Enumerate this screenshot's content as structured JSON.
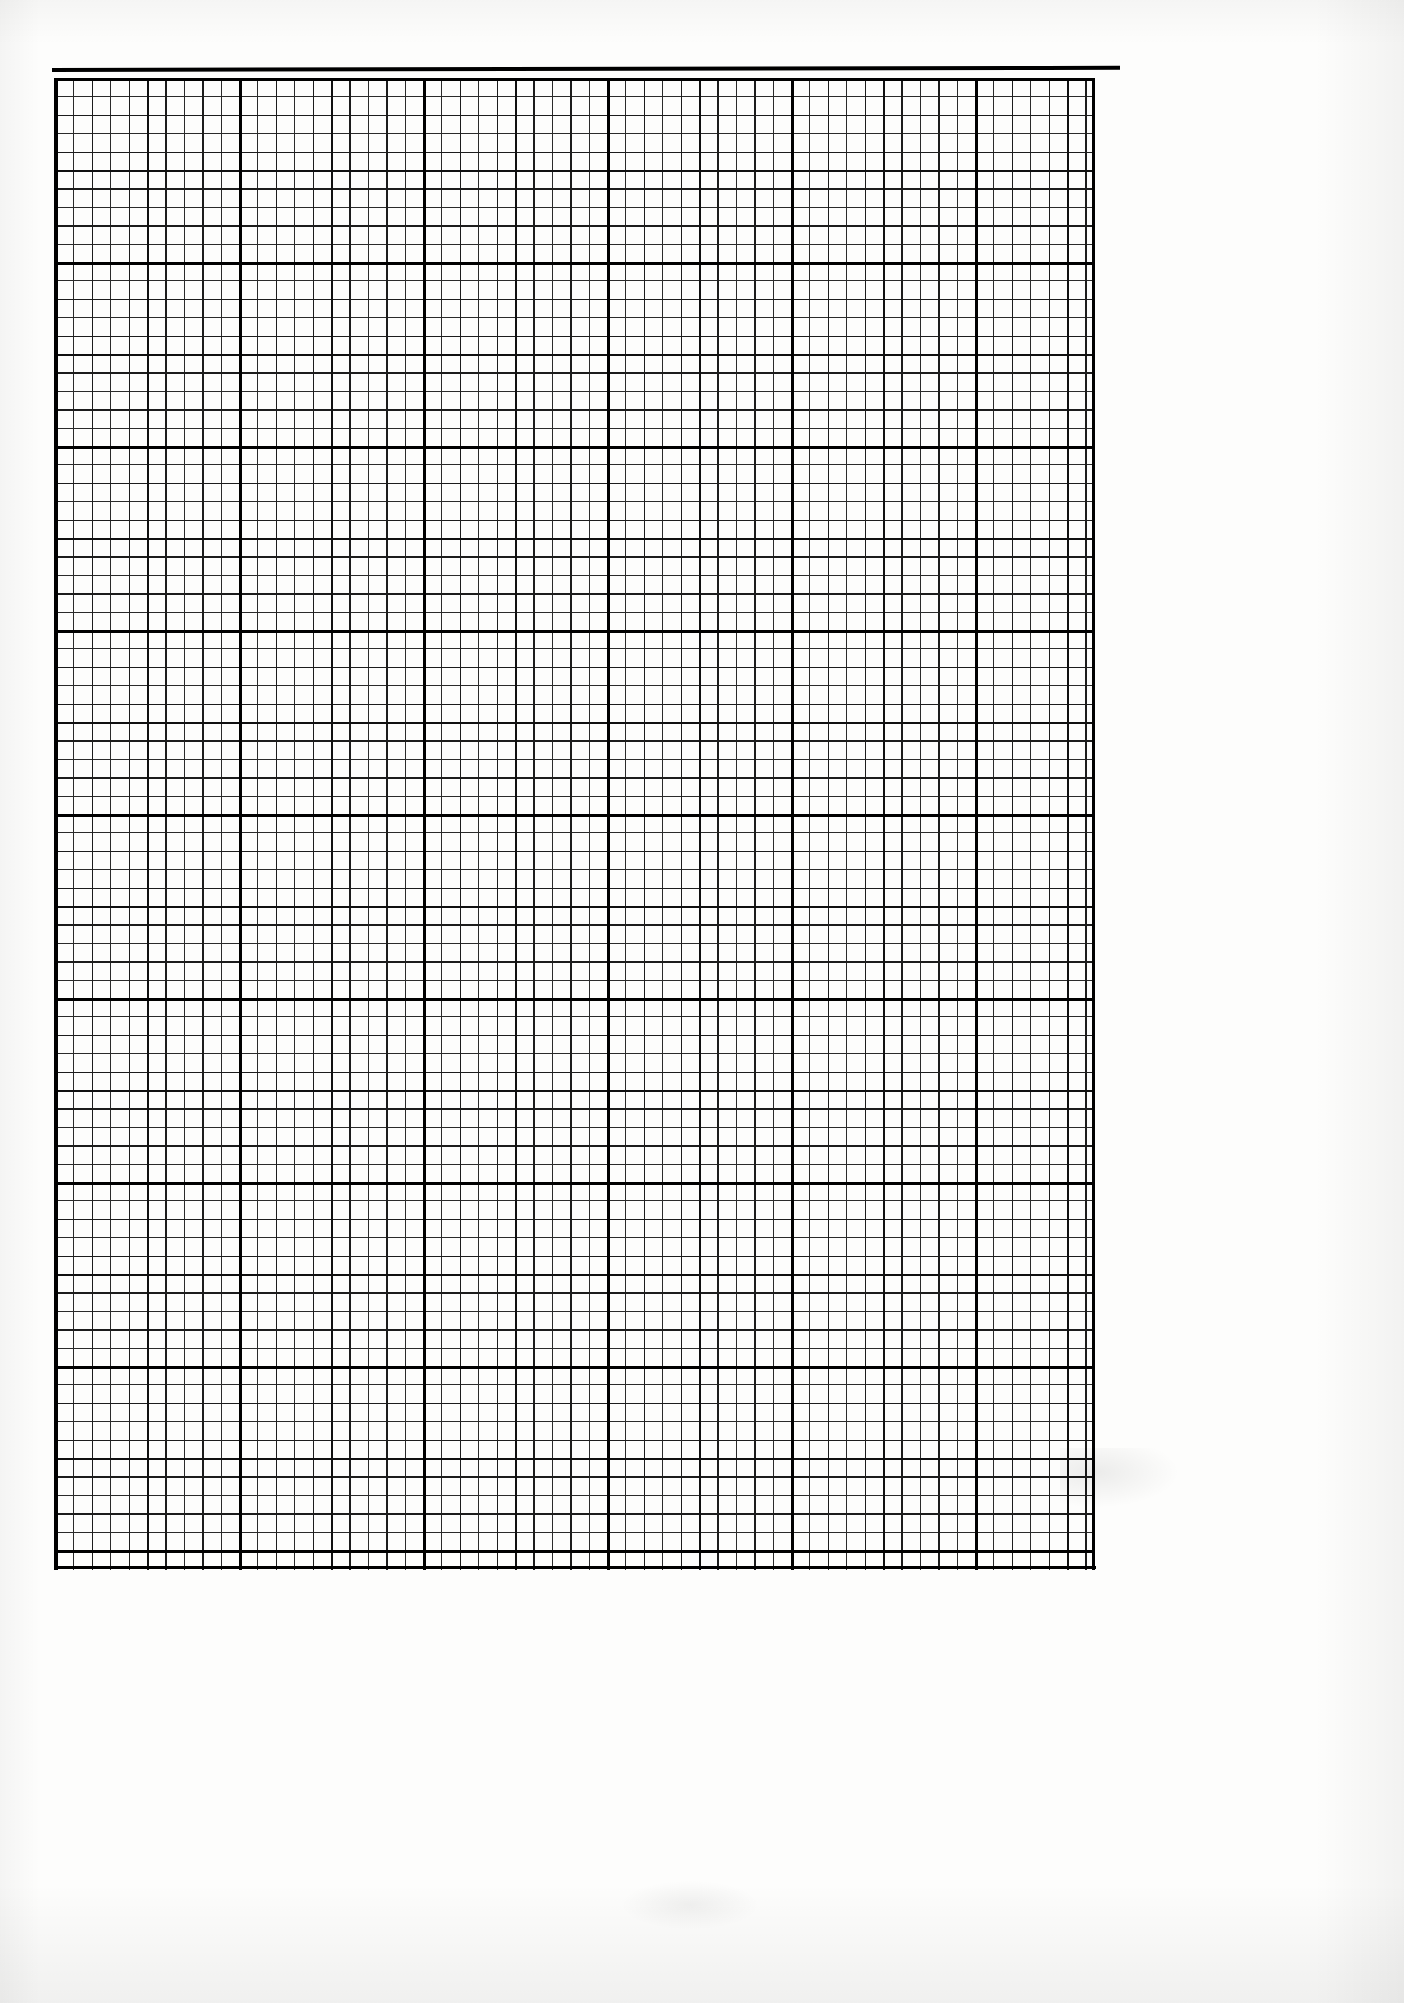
{
  "document": {
    "kind": "graph-paper-scan",
    "title": "Blank graph paper sheet",
    "background_color": "#fdfdfc",
    "ink_color": "#000000",
    "page_width_px": 1404,
    "page_height_px": 2003,
    "text_content": "",
    "annotations": []
  },
  "grid": {
    "description": "Blank engineering / millimetre graph paper, no labels, no data drawn",
    "origin_x_px": 55,
    "origin_y_px": 78,
    "width_px": 1040,
    "height_px": 1492,
    "fine_cell_px": 18.4,
    "columns_fine": 56,
    "rows_fine": 81,
    "levels": [
      {
        "name": "fine",
        "every_units": 1,
        "spacing_px": 18.4,
        "thickness_px": 1.1,
        "color": "#2a2a2a"
      },
      {
        "name": "medium",
        "every_units": 2,
        "spacing_px": 36.8,
        "thickness_px": 1.5,
        "color": "#1c1c1c"
      },
      {
        "name": "bold",
        "every_units": 5,
        "spacing_px": 92.0,
        "thickness_px": 2.3,
        "color": "#101010"
      },
      {
        "name": "extra-bold",
        "every_units": 10,
        "spacing_px": 184.0,
        "thickness_px": 3.1,
        "color": "#000000"
      }
    ],
    "frame": {
      "top_rule": true,
      "left_edge": true,
      "right_edge": true,
      "bottom_edge": true,
      "top_rule_thickness_px": 3.5,
      "skew_deg": -0.12
    }
  },
  "chart_data": {
    "type": "table",
    "title": "",
    "subtitle": "",
    "xlabel": "",
    "ylabel": "",
    "categories": [],
    "values": [],
    "series": [],
    "legend": [],
    "annotations": [],
    "grid": true,
    "note": "Blank graph paper — no plotted data, no tick labels, no legend."
  }
}
